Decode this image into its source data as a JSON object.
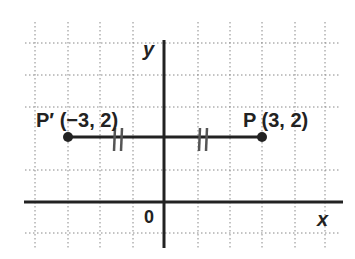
{
  "diagram": {
    "type": "coordinate-plane-reflection",
    "axes": {
      "x_label": "x",
      "y_label": "y",
      "origin_label": "0"
    },
    "points": [
      {
        "name": "P",
        "label": "P (3, 2)",
        "x": 3,
        "y": 2
      },
      {
        "name": "P'",
        "label": "P′ (−3, 2)",
        "x": -3,
        "y": 2
      }
    ],
    "segment": {
      "from": "P'",
      "to": "P",
      "congruence_marks": "||"
    },
    "grid": {
      "x_range": [
        -4,
        5
      ],
      "y_range": [
        -1,
        5
      ],
      "style": "dotted"
    },
    "colors": {
      "axis": "#222222",
      "grid": "#888888",
      "point": "#222222",
      "tick": "#555555"
    }
  }
}
